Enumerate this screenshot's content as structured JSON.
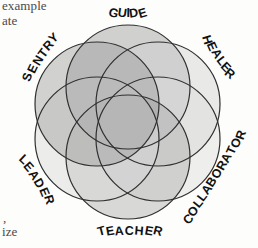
{
  "figure": {
    "background_color": "#fdfdfc",
    "outline_color": "#2f2f2f"
  },
  "page_text_fragments": [
    {
      "id": "frag-example",
      "text": "example"
    },
    {
      "id": "frag-ate",
      "text": "ate"
    },
    {
      "id": "frag-comma",
      "text": ","
    },
    {
      "id": "frag-ize",
      "text": "ize"
    }
  ],
  "chart_data": {
    "type": "pie",
    "xlabel": "",
    "ylabel": "",
    "legend_position": "around-perimeter",
    "grid": false,
    "categories": [
      "GUIDE",
      "HEALER",
      "COLLABORATOR",
      "TEACHER",
      "LEADER",
      "SENTRY"
    ],
    "values": [
      1,
      1,
      1,
      1,
      1,
      1
    ]
  },
  "diagram": {
    "center_x": 128,
    "center_y": 122,
    "circle_radius": 62,
    "ring_radius": 35,
    "stroke_width": 1.2,
    "circles": [
      {
        "name": "GUIDE",
        "label": "GUIDE",
        "angle_deg": -90,
        "cx": 128,
        "cy": 87,
        "fill": "#9a9a9a",
        "label_x": 128,
        "label_y": 13,
        "label_rotation": 0,
        "label_arc": -34
      },
      {
        "name": "HEALER",
        "label": "HEALER",
        "angle_deg": -30,
        "cx": 158,
        "cy": 104,
        "fill": "#d2d2d2",
        "label_x": 219,
        "label_y": 57,
        "label_rotation": 56,
        "label_arc": -34
      },
      {
        "name": "COLLABORATOR",
        "label": "COLLABORATOR",
        "angle_deg": 30,
        "cx": 158,
        "cy": 139,
        "fill": "#dcdcdc",
        "label_x": 214,
        "label_y": 177,
        "label_rotation": -58,
        "label_arc": -26
      },
      {
        "name": "TEACHER",
        "label": "TEACHER",
        "angle_deg": 90,
        "cx": 128,
        "cy": 157,
        "fill": "#adadad",
        "label_x": 130,
        "label_y": 231,
        "label_rotation": 0,
        "label_arc": 30
      },
      {
        "name": "LEADER",
        "label": "LEADER",
        "angle_deg": 150,
        "cx": 97,
        "cy": 139,
        "fill": "#d8d8d8",
        "label_x": 37,
        "label_y": 180,
        "label_rotation": 58,
        "label_arc": 30
      },
      {
        "name": "SENTRY",
        "label": "SENTRY",
        "angle_deg": -150,
        "cx": 97,
        "cy": 104,
        "fill": "#9d9d9d",
        "label_x": 40,
        "label_y": 57,
        "label_rotation": -56,
        "label_arc": 30
      }
    ]
  }
}
